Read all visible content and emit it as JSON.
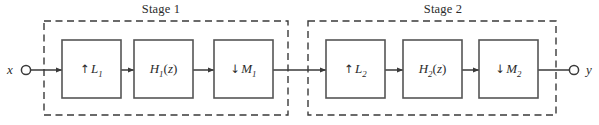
{
  "figure": {
    "type": "block-diagram",
    "width": 599,
    "height": 125,
    "background_color": "#ffffff",
    "line_color": "#3a3a3a",
    "text_color": "#2b2b2b"
  },
  "io": {
    "input": {
      "label": "x",
      "label_x": 10,
      "terminal_x": 25,
      "terminal_y": 70
    },
    "output": {
      "label": "y",
      "label_x": 588,
      "terminal_x": 572,
      "terminal_y": 70
    }
  },
  "stages": [
    {
      "id": "stage-1",
      "label": "Stage 1",
      "label_x": 161,
      "label_y": 3,
      "box": {
        "x": 44,
        "y": 21,
        "w": 244,
        "h": 94
      },
      "blocks": [
        {
          "id": "upsampler-1",
          "kind": "upsampler",
          "arrow": "↑",
          "symbol": "L",
          "subscript": "1",
          "text": "↑ L1",
          "x": 62,
          "y": 40,
          "w": 59,
          "h": 58
        },
        {
          "id": "filter-1",
          "kind": "filter",
          "arrow": "",
          "symbol": "H",
          "subscript": "1",
          "suffix": "(z)",
          "text": "H1(z)",
          "x": 134,
          "y": 40,
          "w": 59,
          "h": 58
        },
        {
          "id": "downsampler-1",
          "kind": "downsampler",
          "arrow": "↓",
          "symbol": "M",
          "subscript": "1",
          "text": "↓ M1",
          "x": 214,
          "y": 40,
          "w": 59,
          "h": 58
        }
      ]
    },
    {
      "id": "stage-2",
      "label": "Stage 2",
      "label_x": 443,
      "label_y": 3,
      "box": {
        "x": 308,
        "y": 21,
        "w": 248,
        "h": 94
      },
      "blocks": [
        {
          "id": "upsampler-2",
          "kind": "upsampler",
          "arrow": "↑",
          "symbol": "L",
          "subscript": "2",
          "text": "↑ L2",
          "x": 326,
          "y": 40,
          "w": 59,
          "h": 58
        },
        {
          "id": "filter-2",
          "kind": "filter",
          "arrow": "",
          "symbol": "H",
          "subscript": "2",
          "suffix": "(z)",
          "text": "H2(z)",
          "x": 403,
          "y": 40,
          "w": 59,
          "h": 58
        },
        {
          "id": "downsampler-2",
          "kind": "downsampler",
          "arrow": "↓",
          "symbol": "M",
          "subscript": "2",
          "text": "↓ M2",
          "x": 479,
          "y": 40,
          "w": 59,
          "h": 58
        }
      ]
    }
  ],
  "signal_path_y": 70,
  "connections": [
    {
      "id": "conn-input-to-up1",
      "from_x": 31,
      "to_x": 62,
      "arrowhead": true
    },
    {
      "id": "conn-up1-to-h1",
      "from_x": 121,
      "to_x": 134,
      "arrowhead": true
    },
    {
      "id": "conn-h1-to-down1",
      "from_x": 193,
      "to_x": 214,
      "arrowhead": true
    },
    {
      "id": "conn-down1-to-up2",
      "from_x": 273,
      "to_x": 326,
      "arrowhead": true
    },
    {
      "id": "conn-up2-to-h2",
      "from_x": 385,
      "to_x": 403,
      "arrowhead": true
    },
    {
      "id": "conn-h2-to-down2",
      "from_x": 462,
      "to_x": 479,
      "arrowhead": true
    },
    {
      "id": "conn-down2-to-output",
      "from_x": 538,
      "to_x": 572,
      "arrowhead": false
    }
  ]
}
